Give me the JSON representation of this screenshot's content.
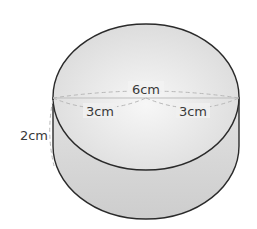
{
  "figure": {
    "type": "cylinder",
    "labels": {
      "diameter": "6cm",
      "radius_left": "3cm",
      "radius_right": "3cm",
      "height": "2cm"
    },
    "colors": {
      "outline": "#2a2a2a",
      "dashed": "#b8b8b8",
      "fill_top": "#ececec",
      "fill_side": "#d4d4d4",
      "text": "#3a3a3a"
    }
  }
}
